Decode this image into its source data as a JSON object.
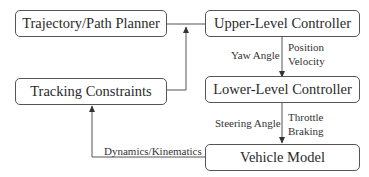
{
  "diagram": {
    "nodes": [
      {
        "id": "planner",
        "label": "Trajectory/Path Planner"
      },
      {
        "id": "upper",
        "label": "Upper-Level Controller"
      },
      {
        "id": "constraints",
        "label": "Tracking Constraints"
      },
      {
        "id": "lower",
        "label": "Lower-Level Controller"
      },
      {
        "id": "vehicle",
        "label": "Vehicle Model"
      }
    ],
    "edges": [
      {
        "from": "planner",
        "to": "upper",
        "label": ""
      },
      {
        "from": "constraints",
        "to": "upper",
        "label": ""
      },
      {
        "from": "upper",
        "to": "lower",
        "label_left": "Yaw Angle",
        "label_right_1": "Position",
        "label_right_2": "Velocity"
      },
      {
        "from": "lower",
        "to": "vehicle",
        "label_left": "Steering Angle",
        "label_right_1": "Throttle",
        "label_right_2": "Braking"
      },
      {
        "from": "vehicle",
        "to": "constraints",
        "label": "Dynamics/Kinematics"
      }
    ],
    "colors": {
      "stroke": "#555555",
      "text": "#2a2a2a"
    }
  }
}
